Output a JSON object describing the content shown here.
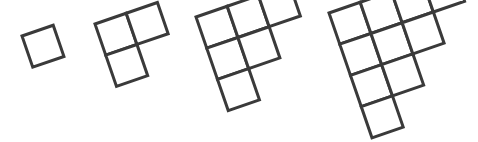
{
  "canvas": {
    "width": 478,
    "height": 142,
    "background_color": "#ffffff"
  },
  "style": {
    "stroke_color": "#3a3a3a",
    "fill_color": "#ffffff",
    "stroke_width": 3,
    "cell_size": 33,
    "rotation_degrees": -19
  },
  "pattern": {
    "description": "Growing staircase pattern of unit squares, rotated clockwise",
    "sequence_values": [
      1,
      3,
      6,
      10
    ],
    "figures": [
      {
        "name": "figure-1",
        "square_count": 1,
        "rows": [
          1
        ],
        "origin_x": 22,
        "origin_y": 36,
        "cells": [
          {
            "row": 0,
            "col": 0
          }
        ]
      },
      {
        "name": "figure-2",
        "square_count": 3,
        "rows": [
          2,
          1
        ],
        "origin_x": 95,
        "origin_y": 24,
        "cells": [
          {
            "row": 0,
            "col": 0
          },
          {
            "row": 0,
            "col": 1
          },
          {
            "row": 1,
            "col": 0
          }
        ]
      },
      {
        "name": "figure-3",
        "square_count": 6,
        "rows": [
          3,
          2,
          1
        ],
        "origin_x": 196,
        "origin_y": 17,
        "cells": [
          {
            "row": 0,
            "col": 0
          },
          {
            "row": 0,
            "col": 1
          },
          {
            "row": 0,
            "col": 2
          },
          {
            "row": 1,
            "col": 0
          },
          {
            "row": 1,
            "col": 1
          },
          {
            "row": 2,
            "col": 0
          }
        ]
      },
      {
        "name": "figure-4",
        "square_count": 10,
        "rows": [
          4,
          3,
          2,
          1
        ],
        "origin_x": 329,
        "origin_y": 13,
        "cells": [
          {
            "row": 0,
            "col": 0
          },
          {
            "row": 0,
            "col": 1
          },
          {
            "row": 0,
            "col": 2
          },
          {
            "row": 0,
            "col": 3
          },
          {
            "row": 1,
            "col": 0
          },
          {
            "row": 1,
            "col": 1
          },
          {
            "row": 1,
            "col": 2
          },
          {
            "row": 2,
            "col": 0
          },
          {
            "row": 2,
            "col": 1
          },
          {
            "row": 3,
            "col": 0
          }
        ]
      }
    ]
  }
}
